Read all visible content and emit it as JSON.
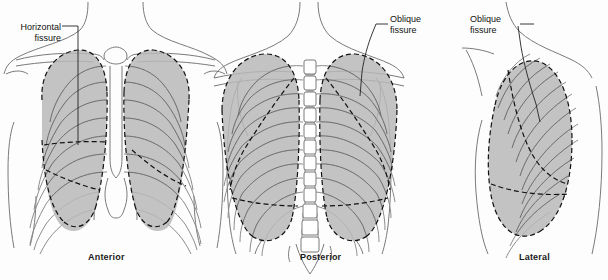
{
  "figure": {
    "background_color": "#fdfdfd",
    "lung_fill_color": "#b8b8b8",
    "outline_color": "#6e6e6e",
    "fissure_color": "#111111",
    "rib_color": "#808080",
    "text_color": "#111111"
  },
  "panels": [
    {
      "id": "anterior",
      "caption": "Anterior"
    },
    {
      "id": "posterior",
      "caption": "Posterior"
    },
    {
      "id": "lateral",
      "caption": "Lateral"
    }
  ],
  "callouts": [
    {
      "id": "horizontal-fissure",
      "panel": "anterior",
      "line1": "Horizontal",
      "line2": "fissure",
      "align": "right"
    },
    {
      "id": "oblique-fissure-posterior",
      "panel": "posterior",
      "line1": "Oblique",
      "line2": "fissure",
      "align": "left"
    },
    {
      "id": "oblique-fissure-lateral",
      "panel": "lateral",
      "line1": "Oblique",
      "line2": "fissure",
      "align": "left"
    }
  ]
}
